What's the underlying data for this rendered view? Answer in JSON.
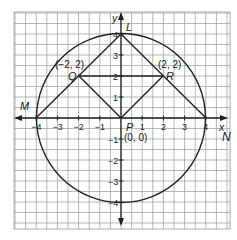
{
  "diagram": {
    "axes": {
      "x_label": "x",
      "y_label": "y",
      "x_ticks": [
        {
          "value": -4,
          "label": "-4"
        },
        {
          "value": -3,
          "label": "-3"
        },
        {
          "value": -2,
          "label": "-2"
        },
        {
          "value": -1,
          "label": "-1"
        },
        {
          "value": 1,
          "label": "1"
        },
        {
          "value": 2,
          "label": "2"
        },
        {
          "value": 3,
          "label": "3"
        },
        {
          "value": 4,
          "label": "4"
        }
      ],
      "y_ticks": [
        {
          "value": 4,
          "label": "4"
        },
        {
          "value": 3,
          "label": "3"
        },
        {
          "value": 2,
          "label": "2"
        },
        {
          "value": 1,
          "label": "1"
        },
        {
          "value": -1,
          "label": "-1"
        },
        {
          "value": -2,
          "label": "-2"
        },
        {
          "value": -3,
          "label": "-3"
        },
        {
          "value": -4,
          "label": "-4"
        }
      ]
    },
    "circle": {
      "center": [
        0,
        0
      ],
      "radius": 4
    },
    "points": {
      "L": {
        "label": "L",
        "coords": [
          0,
          4
        ]
      },
      "M": {
        "label": "M",
        "coords": [
          -4,
          0
        ]
      },
      "N": {
        "label": "N",
        "coords": [
          4,
          0
        ]
      },
      "P": {
        "label": "P",
        "coords": [
          0,
          0
        ],
        "coord_text": "(0, 0)"
      },
      "Q": {
        "label": "Q",
        "coords": [
          -2,
          2
        ],
        "coord_text": "(−2, 2)"
      },
      "R": {
        "label": "R",
        "coords": [
          2,
          2
        ],
        "coord_text": "(2, 2)"
      }
    },
    "segments": [
      [
        "M",
        "L"
      ],
      [
        "L",
        "N"
      ],
      [
        "Q",
        "R"
      ],
      [
        "Q",
        "P"
      ],
      [
        "P",
        "R"
      ]
    ]
  }
}
